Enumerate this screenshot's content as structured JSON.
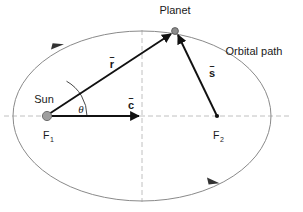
{
  "figure": {
    "type": "orbital-mechanics-diagram",
    "background_color": "#ffffff"
  },
  "labels": {
    "planet": "Planet",
    "orbital_path": "Orbital path",
    "sun": "Sun",
    "focus_1": "F",
    "focus_1_sub": "1",
    "focus_2": "F",
    "focus_2_sub": "2",
    "theta": "θ",
    "vector_r": "r",
    "vector_c": "c",
    "vector_s": "s",
    "vector_accent": "–"
  },
  "colors": {
    "ellipse_stroke": "#8a8a8a",
    "axis_dashed": "#c0c0c0",
    "vector_stroke": "#111111",
    "sun_fill": "#9e9e9e",
    "sun_stroke": "#6f6f6f",
    "planet_fill": "#8c8c8c",
    "planet_stroke": "#5a5a5a",
    "focus2_fill": "#111111",
    "text": "#1a1a1a"
  },
  "geometry": {
    "ellipse": {
      "cx": 142,
      "cy": 116,
      "rx": 129,
      "ry": 85
    },
    "focus_1": {
      "x": 47,
      "y": 116
    },
    "focus_2": {
      "x": 217,
      "y": 116
    },
    "planet": {
      "x": 175,
      "y": 31
    },
    "center": {
      "x": 142,
      "y": 116
    },
    "horizontal_axis": {
      "x1": 4,
      "y1": 116,
      "x2": 292,
      "y2": 116
    },
    "vertical_axis": {
      "x1": 142,
      "y1": 30,
      "x2": 142,
      "y2": 202
    },
    "theta_arc_radius": 40,
    "orbit_direction": "counter-clockwise",
    "direction_marker_1": {
      "x": 58,
      "y": 46
    },
    "direction_marker_2": {
      "x": 213,
      "y": 180
    }
  },
  "label_positions": {
    "planet": {
      "x": 175,
      "y": 14
    },
    "orbital_path": {
      "x": 254,
      "y": 55
    },
    "sun": {
      "x": 44,
      "y": 103
    },
    "focus_1": {
      "x": 47,
      "y": 137
    },
    "focus_2": {
      "x": 217,
      "y": 137
    },
    "theta": {
      "x": 81,
      "y": 112
    },
    "vector_r": {
      "x": 112,
      "y": 66
    },
    "vector_c": {
      "x": 131,
      "y": 108
    },
    "vector_s": {
      "x": 212,
      "y": 76
    }
  }
}
